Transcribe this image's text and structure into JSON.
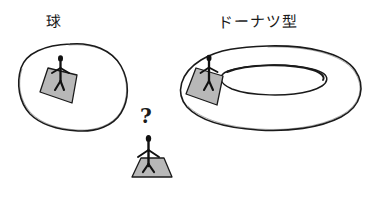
{
  "figure": {
    "title_left": "球",
    "title_right": "ドーナツ型",
    "question_marker": "?",
    "background_color": "#ffffff",
    "ink_color": "#1a1a1a",
    "fill_gray": "#b8b8b8",
    "shade_gray": "#a8a8a8"
  },
  "objects": {
    "sphere": {
      "name": "球",
      "kind": "sphere-outline",
      "has_figure": true,
      "has_platform": true
    },
    "torus": {
      "name": "ドーナツ型",
      "kind": "torus-outline",
      "has_figure": true,
      "has_platform": true,
      "has_hole": true
    },
    "observer": {
      "name": "standing-person",
      "has_platform": true,
      "question": "?"
    }
  }
}
